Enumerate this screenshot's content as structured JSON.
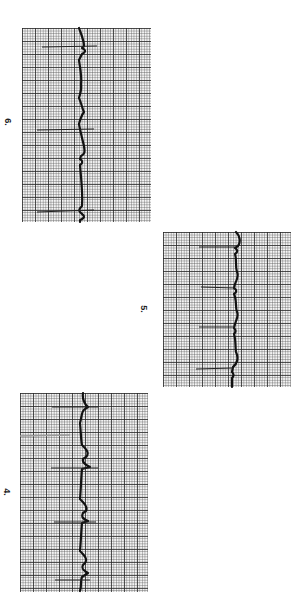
{
  "page": {
    "orientation": "rotated 90 degrees clockwise",
    "background": "#ffffff",
    "grid_color": "#3a3a3a",
    "trace_color": "#111111"
  },
  "strips": [
    {
      "label": "6.",
      "rhythm_complexes": 3,
      "description": "ECG rhythm strip with 3 visible QRS complexes"
    },
    {
      "label": "5.",
      "rhythm_complexes": 4,
      "description": "ECG rhythm strip with 4 visible QRS complexes"
    },
    {
      "label": "4.",
      "rhythm_complexes": 4,
      "description": "ECG rhythm strip with 4 visible QRS complexes"
    }
  ]
}
